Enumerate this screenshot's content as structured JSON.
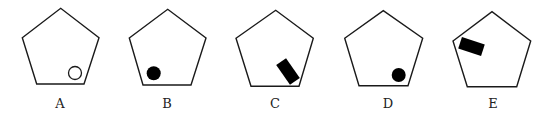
{
  "figure": {
    "options": [
      {
        "label": "A",
        "pentagon": "22.3,37.7 60.7,8.3 99,37.7 84,84 36.7,84",
        "shape": {
          "type": "circle",
          "fill": "none",
          "cx": 75,
          "cy": 73,
          "r": 6.5,
          "position": "bottom-right"
        },
        "label_x": 60
      },
      {
        "label": "B",
        "pentagon": "129.3,38 167.7,9.3 206,38 191,85 143,85",
        "shape": {
          "type": "circle",
          "fill": "black",
          "cx": 153.7,
          "cy": 73.3,
          "r": 7,
          "position": "bottom-left"
        },
        "label_x": 167
      },
      {
        "label": "C",
        "pentagon": "236,38.3 275.7,10.3 313.3,38.3 299,86.3 251,86.3",
        "shape": {
          "type": "rect",
          "fill": "black",
          "cx": 288,
          "cy": 71.5,
          "w": 24,
          "h": 12,
          "angle": 55,
          "position": "bottom-right"
        },
        "label_x": 275
      },
      {
        "label": "D",
        "pentagon": "344.7,38.3 383.3,10.7 422.7,38.3 408,85.7 359,85.7",
        "shape": {
          "type": "circle",
          "fill": "black",
          "cx": 398.7,
          "cy": 75,
          "r": 7,
          "position": "bottom-right"
        },
        "label_x": 388
      },
      {
        "label": "E",
        "pentagon": "453,41 492,11.7 530.7,41 516.7,86.7 467.3,86.7",
        "shape": {
          "type": "rect",
          "fill": "black",
          "cx": 471.5,
          "cy": 46.5,
          "w": 24,
          "h": 12,
          "angle": 18,
          "position": "upper-left"
        },
        "label_x": 493
      }
    ],
    "label_y": 108,
    "stroke_color": "#1a1a1a",
    "fill_color": "#000000"
  }
}
